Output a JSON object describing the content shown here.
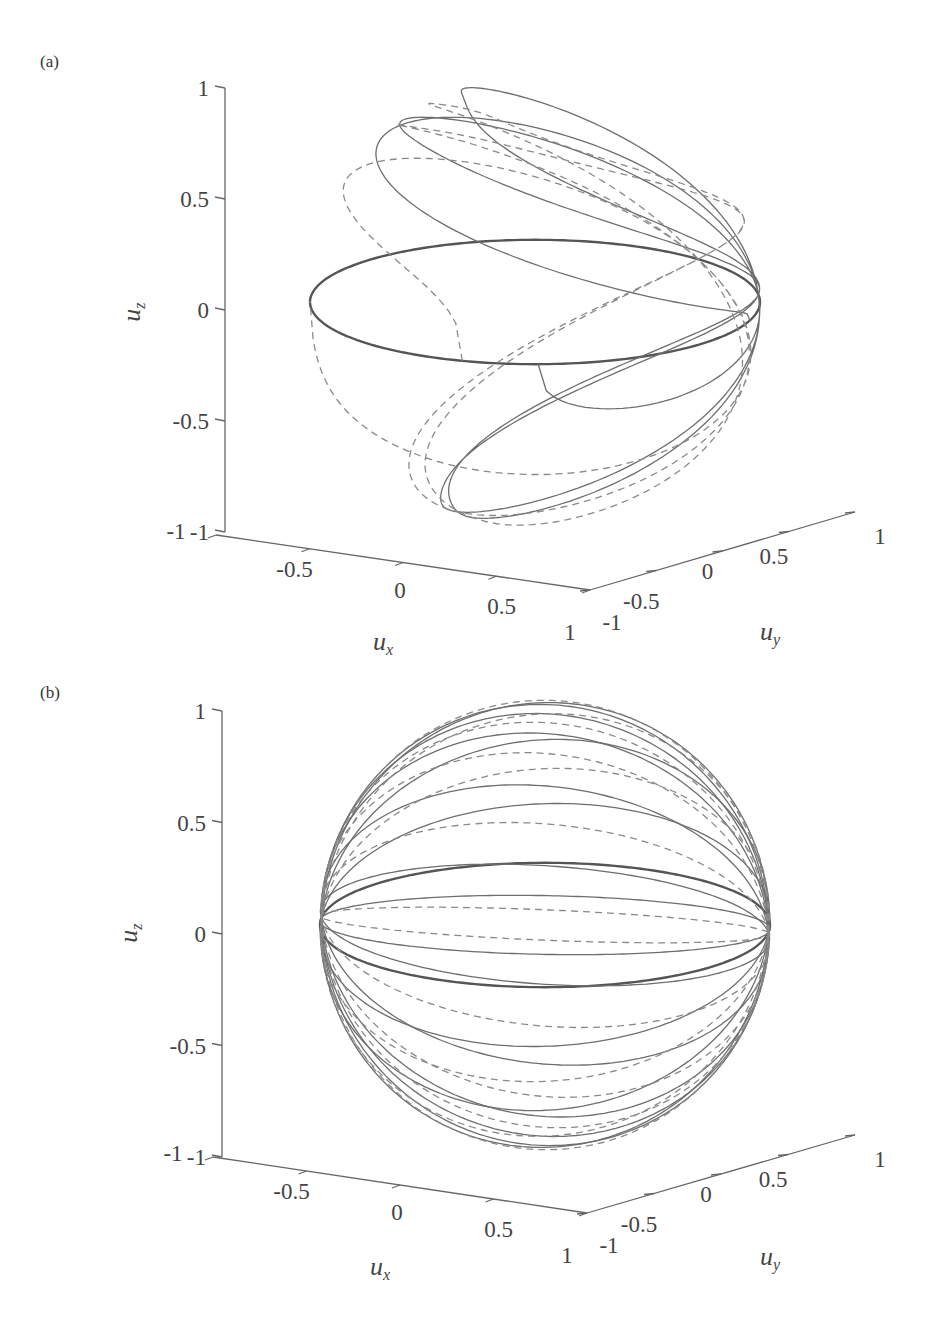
{
  "figure": {
    "panels": [
      {
        "id": "a",
        "label": "(a)"
      },
      {
        "id": "b",
        "label": "(b)"
      }
    ]
  },
  "chart_data": [
    {
      "type": "line",
      "subtype": "3d-trajectory-on-unit-sphere",
      "panel_label": "(a)",
      "xlabel": "u_x",
      "ylabel": "u_y",
      "zlabel": "u_z",
      "xlim": [
        -1,
        1
      ],
      "ylim": [
        -1,
        1
      ],
      "zlim": [
        -1,
        1
      ],
      "xticks": [
        "-1",
        "-0.5",
        "0",
        "0.5",
        "1"
      ],
      "yticks": [
        "-1",
        "-0.5",
        "0",
        "0.5",
        "1"
      ],
      "zticks": [
        "-1",
        "-0.5",
        "0",
        "0.5",
        "1"
      ],
      "grid": false,
      "legend": null,
      "series": [
        {
          "name": "trajectory (solid)",
          "style": "solid",
          "color": "#777777",
          "description": "Wandering loops on unit sphere spanning uz from about -0.95 to 0.95, plus a dense equatorial band near uz = 0"
        },
        {
          "name": "trajectory (dashed)",
          "style": "dashed",
          "color": "#888888",
          "description": "Companion trajectory with similar wandering loops on the sphere"
        }
      ],
      "equatorial_band_uz": 0
    },
    {
      "type": "line",
      "subtype": "3d-trajectory-on-unit-sphere",
      "panel_label": "(b)",
      "xlabel": "u_x",
      "ylabel": "u_y",
      "zlabel": "u_z",
      "xlim": [
        -1,
        1
      ],
      "ylim": [
        -1,
        1
      ],
      "zlim": [
        -1,
        1
      ],
      "xticks": [
        "-1",
        "-0.5",
        "0",
        "0.5",
        "1"
      ],
      "yticks": [
        "-1",
        "-0.5",
        "0",
        "0.5",
        "1"
      ],
      "zticks": [
        "-1",
        "-0.5",
        "0",
        "0.5",
        "1"
      ],
      "grid": false,
      "legend": null,
      "series": [
        {
          "name": "trajectory (solid)",
          "style": "solid",
          "color": "#777777",
          "description": "Great-circle-like orbits all passing through two antipodal points near the equator"
        },
        {
          "name": "trajectory (dashed)",
          "style": "dashed",
          "color": "#888888",
          "description": "Companion great-circle orbits through the same antipodal points"
        }
      ],
      "equatorial_band_uz": 0
    }
  ],
  "axes": {
    "x_label": "u",
    "x_sub": "x",
    "y_label": "u",
    "y_sub": "y",
    "z_label": "u",
    "z_sub": "z",
    "z_ticks": [
      "1",
      "0.5",
      "0",
      "-0.5",
      "-1"
    ],
    "x_ticks": [
      "-1",
      "-0.5",
      "0",
      "0.5",
      "1"
    ],
    "y_ticks": [
      "-1",
      "-0.5",
      "0",
      "0.5",
      "1"
    ]
  },
  "colors": {
    "axis": "#666666",
    "solid": "#6e6e6e",
    "dashed": "#8a8a8a",
    "band": "#555555"
  }
}
